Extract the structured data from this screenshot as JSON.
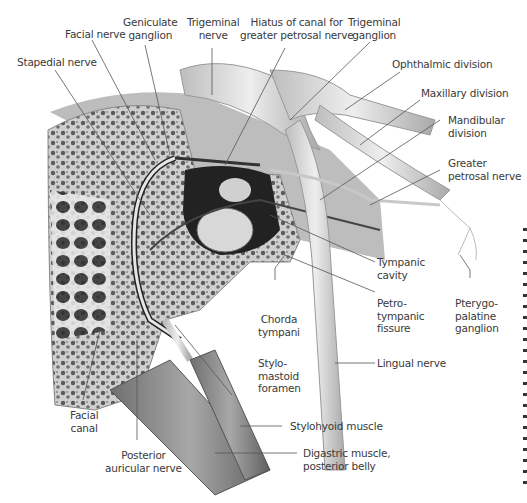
{
  "figure": {
    "style": "grayscale anatomical illustration",
    "colors": {
      "text": "#3a3a3a",
      "leader": "#555555",
      "bone": "#d9d9d9",
      "nerve": "#cfcfcf",
      "muscle": "#8a8a8a"
    }
  },
  "labels": {
    "facial_nerve": "Facial nerve",
    "geniculate_ganglion": "Geniculate\nganglion",
    "trigeminal_nerve": "Trigeminal\nnerve",
    "hiatus": "Hiatus of canal for\ngreater petrosal nerve",
    "trigeminal_ganglion": "Trigeminal\nganglion",
    "stapedial_nerve": "Stapedial nerve",
    "ophthalmic_division": "Ophthalmic division",
    "maxillary_division": "Maxillary division",
    "mandibular_division": "Mandibular\ndivision",
    "greater_petrosal_nerve": "Greater\npetrosal nerve",
    "tympanic_cavity": "Tympanic\ncavity",
    "petrotympanic_fissure": "Petro-\ntympanic\nfissure",
    "pterygopalatine_ganglion": "Pterygo-\npalatine\nganglion",
    "chorda_tympani": "Chorda\ntympani",
    "stylomastoid_foramen": "Stylo-\nmastoid\nforamen",
    "lingual_nerve": "Lingual nerve",
    "stylohyoid_muscle": "Stylohyoid muscle",
    "digastric_muscle": "Digastric muscle,\nposterior belly",
    "facial_canal": "Facial\ncanal",
    "posterior_auricular_nerve": "Posterior\nauricular nerve"
  }
}
